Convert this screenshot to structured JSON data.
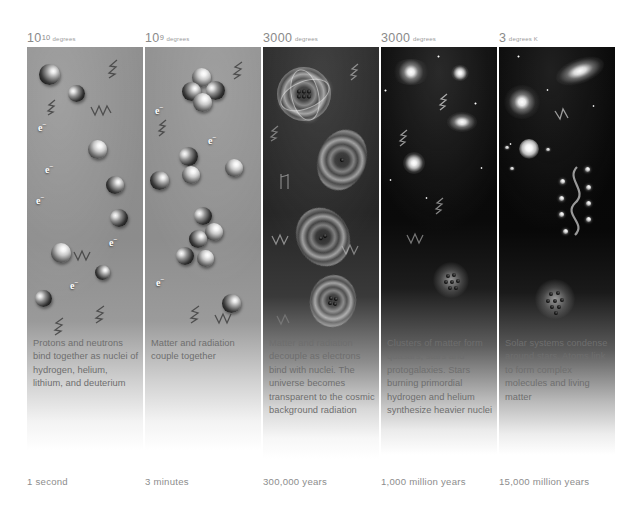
{
  "figure": {
    "panel_count": 5
  },
  "panels": [
    {
      "id": "panel-1",
      "temperature_value": "10",
      "temperature_exponent": "10",
      "temperature_unit": "degrees",
      "caption": "Protons and neutrons bind together as nuclei of hydrogen, helium, lithium, and deuterium",
      "time": "1 second",
      "electron_label": "e",
      "electron_charge": "-",
      "scene": "hot-plasma-free-nucleons"
    },
    {
      "id": "panel-2",
      "temperature_value": "10",
      "temperature_exponent": "9",
      "temperature_unit": "degrees",
      "caption": "Matter and radiation couple together",
      "time": "3 minutes",
      "electron_label": "e",
      "electron_charge": "-",
      "scene": "bound-nuclei-clusters"
    },
    {
      "id": "panel-3",
      "temperature_value": "3000",
      "temperature_exponent": "",
      "temperature_unit": "degrees",
      "caption": "Matter and radiation decouple as electrons bind with nuclei. The universe becomes transparent to the cosmic background radiation",
      "time": "300,000 years",
      "electron_label": "",
      "electron_charge": "",
      "scene": "glowing-atoms"
    },
    {
      "id": "panel-4",
      "temperature_value": "3000",
      "temperature_exponent": "",
      "temperature_unit": "degrees",
      "caption": "Clusters of matter form quasars, stars and protogalaxies. Stars burning primordial hydrogen and helium synthesize heavier nuclei",
      "time": "1,000 million years",
      "electron_label": "",
      "electron_charge": "",
      "scene": "quasars-protogalaxies"
    },
    {
      "id": "panel-5",
      "temperature_value": "3",
      "temperature_exponent": "",
      "temperature_unit": "degrees K",
      "caption": "Solar systems condense around stars. Atoms link to form complex molecules and living matter",
      "time": "15,000 million years",
      "electron_label": "",
      "electron_charge": "",
      "scene": "solar-systems-molecules"
    }
  ],
  "colors": {
    "plasma_grey": "#8f8f8f",
    "atom_dark": "#2a2a2a",
    "space_black": "#070707",
    "text_grey": "#6e6e6e",
    "label_grey": "#8a8a8a",
    "page_background": "#ffffff"
  }
}
